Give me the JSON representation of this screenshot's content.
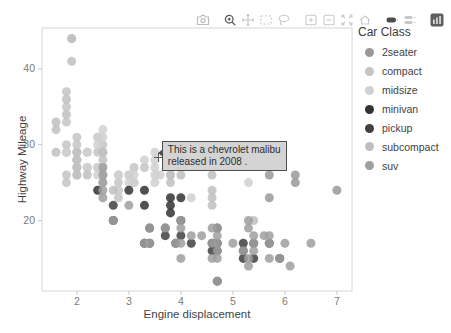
{
  "window": {
    "background": "#ffffff"
  },
  "modebar": {
    "icons": [
      "camera-icon",
      "zoom-icon",
      "pan-icon",
      "box-select-icon",
      "lasso-select-icon",
      "zoom-in-icon",
      "zoom-out-icon",
      "autoscale-icon",
      "reset-axes-icon",
      "hover-closest-icon",
      "hover-compare-icon",
      "plotly-logo-icon"
    ],
    "active_icons": [
      "zoom-icon",
      "hover-closest-icon"
    ]
  },
  "tooltip": {
    "line1": "This is a chevrolet malibu",
    "line2": "released in 2008 .",
    "anchor_point": {
      "displ": 3.5,
      "hwy": 29
    }
  },
  "chart_data": {
    "type": "scatter",
    "title": "",
    "xlabel": "Engine displacement",
    "ylabel": "Highway Mileage",
    "xlim": [
      1.33,
      7.29
    ],
    "ylim": [
      10.7,
      45.4
    ],
    "xticks": [
      2,
      3,
      4,
      5,
      6,
      7
    ],
    "yticks": [
      20,
      30,
      40
    ],
    "grid": false,
    "legend_title": "Car Class",
    "legend_position": "right",
    "marker_size": 9,
    "colors": {
      "axis_frame": "#d6d6d6",
      "tick_line": "#c6c6c6",
      "tick_text": "#7a7a7a",
      "tooltip_bg": "#d4d4d4",
      "tooltip_border": "#4f4f4f"
    },
    "series": [
      {
        "name": "2seater",
        "color": "#999999",
        "points": [
          [
            5.7,
            26
          ],
          [
            5.7,
            23
          ],
          [
            6.2,
            26
          ],
          [
            6.2,
            25
          ],
          [
            7,
            24
          ]
        ]
      },
      {
        "name": "compact",
        "color": "#c4c4c4",
        "points": [
          [
            1.8,
            29
          ],
          [
            1.8,
            26
          ],
          [
            1.8,
            25
          ],
          [
            1.8,
            30
          ],
          [
            1.8,
            33
          ],
          [
            1.8,
            35
          ],
          [
            1.8,
            37
          ],
          [
            1.9,
            44
          ],
          [
            2,
            31
          ],
          [
            2,
            30
          ],
          [
            2,
            28
          ],
          [
            2,
            27
          ],
          [
            2,
            29
          ],
          [
            2,
            26
          ],
          [
            2.2,
            27
          ],
          [
            2.2,
            29
          ],
          [
            2.4,
            29
          ],
          [
            2.4,
            27
          ],
          [
            2.4,
            31
          ],
          [
            2.5,
            25
          ],
          [
            2.5,
            27
          ],
          [
            2.5,
            29
          ],
          [
            2.5,
            30
          ],
          [
            2.8,
            26
          ],
          [
            2.8,
            25
          ],
          [
            2.8,
            24
          ],
          [
            2.8,
            23
          ],
          [
            3,
            26
          ],
          [
            3.1,
            27
          ],
          [
            3.1,
            25
          ],
          [
            3.3,
            27
          ]
        ]
      },
      {
        "name": "midsize",
        "color": "#d0d0d0",
        "points": [
          [
            1.8,
            29
          ],
          [
            2,
            28
          ],
          [
            2,
            29
          ],
          [
            2.2,
            29
          ],
          [
            2.2,
            27
          ],
          [
            2.4,
            27
          ],
          [
            2.4,
            30
          ],
          [
            2.4,
            26
          ],
          [
            2.4,
            31
          ],
          [
            2.5,
            26
          ],
          [
            2.5,
            31
          ],
          [
            2.5,
            32
          ],
          [
            2.8,
            24
          ],
          [
            2.8,
            26
          ],
          [
            3,
            26
          ],
          [
            3,
            25
          ],
          [
            3.1,
            25
          ],
          [
            3.1,
            26
          ],
          [
            3.3,
            28
          ],
          [
            3.5,
            29
          ],
          [
            3.5,
            27
          ],
          [
            3.5,
            26
          ],
          [
            3.5,
            25
          ],
          [
            3.5,
            28
          ],
          [
            3.6,
            26
          ],
          [
            3.8,
            26
          ],
          [
            3.8,
            27
          ],
          [
            3.8,
            28
          ],
          [
            4.2,
            23
          ],
          [
            5.3,
            25
          ]
        ]
      },
      {
        "name": "minivan",
        "color": "#333333",
        "points": [
          [
            2.4,
            24
          ],
          [
            3,
            24
          ],
          [
            3.3,
            22
          ],
          [
            3.3,
            24
          ],
          [
            3.3,
            17
          ],
          [
            3.8,
            22
          ],
          [
            3.8,
            21
          ],
          [
            3.8,
            23
          ],
          [
            4,
            23
          ]
        ]
      },
      {
        "name": "pickup",
        "color": "#404040",
        "points": [
          [
            2.7,
            20
          ],
          [
            2.7,
            22
          ],
          [
            3.4,
            17
          ],
          [
            3.4,
            19
          ],
          [
            3.7,
            19
          ],
          [
            3.7,
            18
          ],
          [
            3.9,
            17
          ],
          [
            4,
            18
          ],
          [
            4,
            20
          ],
          [
            4.2,
            17
          ],
          [
            4.6,
            16
          ],
          [
            4.6,
            17
          ],
          [
            4.7,
            19
          ],
          [
            4.7,
            12
          ],
          [
            4.7,
            16
          ],
          [
            4.7,
            17
          ],
          [
            5.2,
            17
          ],
          [
            5.2,
            15
          ],
          [
            5.2,
            16
          ],
          [
            5.4,
            15
          ],
          [
            5.4,
            17
          ],
          [
            5.7,
            17
          ],
          [
            5.9,
            15
          ]
        ]
      },
      {
        "name": "subcompact",
        "color": "#bfbfbf",
        "points": [
          [
            1.6,
            33
          ],
          [
            1.6,
            32
          ],
          [
            1.6,
            29
          ],
          [
            1.8,
            34
          ],
          [
            1.8,
            36
          ],
          [
            1.9,
            44
          ],
          [
            1.9,
            41
          ],
          [
            2,
            29
          ],
          [
            2,
            26
          ],
          [
            2,
            28
          ],
          [
            2,
            27
          ],
          [
            2.2,
            26
          ],
          [
            2.5,
            26
          ],
          [
            2.5,
            28
          ],
          [
            2.5,
            29
          ],
          [
            2.7,
            24
          ],
          [
            3.8,
            26
          ],
          [
            3.8,
            25
          ],
          [
            4,
            26
          ],
          [
            4.6,
            24
          ],
          [
            4.6,
            26
          ],
          [
            4.6,
            23
          ],
          [
            4.6,
            22
          ],
          [
            5.4,
            20
          ]
        ]
      },
      {
        "name": "suv",
        "color": "#9f9f9f",
        "points": [
          [
            2.5,
            25
          ],
          [
            2.5,
            24
          ],
          [
            2.5,
            27
          ],
          [
            2.5,
            26
          ],
          [
            2.5,
            23
          ],
          [
            2.7,
            20
          ],
          [
            3,
            22
          ],
          [
            3.3,
            17
          ],
          [
            3.4,
            19
          ],
          [
            3.4,
            17
          ],
          [
            3.7,
            19
          ],
          [
            3.9,
            17
          ],
          [
            4,
            17
          ],
          [
            4,
            19
          ],
          [
            4,
            20
          ],
          [
            4,
            15
          ],
          [
            4.2,
            18
          ],
          [
            4.4,
            18
          ],
          [
            4.6,
            17
          ],
          [
            4.6,
            19
          ],
          [
            4.6,
            15
          ],
          [
            4.7,
            17
          ],
          [
            4.7,
            12
          ],
          [
            4.7,
            16
          ],
          [
            4.7,
            18
          ],
          [
            4.7,
            19
          ],
          [
            4.7,
            15
          ],
          [
            5,
            17
          ],
          [
            5.2,
            16
          ],
          [
            5.3,
            20
          ],
          [
            5.3,
            15
          ],
          [
            5.3,
            19
          ],
          [
            5.3,
            14
          ],
          [
            5.4,
            17
          ],
          [
            5.4,
            18
          ],
          [
            5.4,
            16
          ],
          [
            5.6,
            18
          ],
          [
            5.7,
            17
          ],
          [
            5.7,
            15
          ],
          [
            5.7,
            18
          ],
          [
            5.9,
            15
          ],
          [
            6,
            17
          ],
          [
            6.1,
            14
          ],
          [
            6.5,
            17
          ]
        ]
      }
    ]
  }
}
